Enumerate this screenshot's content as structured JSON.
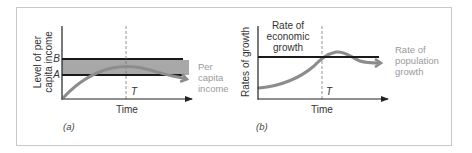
{
  "colors": {
    "frame": "#c8c8c8",
    "axis": "#222222",
    "bound_line": "#1a1a1a",
    "band": "#a8a8a8",
    "curve": "#8c8c8c",
    "label_gray": "#9a9a9a",
    "text": "#333333"
  },
  "panels": [
    {
      "id": "a",
      "caption": "(a)",
      "y_axis_label": [
        "Level of per",
        "capita income"
      ],
      "x_axis_label": "Time",
      "marker_T": "T",
      "bound_labels": {
        "upper": "B",
        "lower": "A"
      },
      "curve_label": [
        "Per",
        "capita",
        "income"
      ]
    },
    {
      "id": "b",
      "caption": "(b)",
      "y_axis_label": [
        "Rates of growth"
      ],
      "x_axis_label": "Time",
      "marker_T": "T",
      "line_label": [
        "Rate of",
        "economic",
        "growth"
      ],
      "curve_label": [
        "Rate of",
        "population",
        "growth"
      ]
    }
  ]
}
